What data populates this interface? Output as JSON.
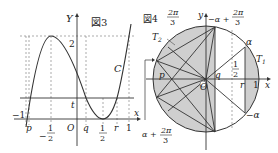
{
  "figure3": {
    "caption": "図3",
    "axis_x": "x",
    "axis_y": "Y",
    "origin": "O",
    "curve_label": "C",
    "y_tick_2": "2",
    "t_label": "t",
    "neg_one": "−1",
    "p": "p",
    "q": "q",
    "r": "r",
    "one": "1",
    "neg_half_sign": "−",
    "half_num": "1",
    "half_den": "2",
    "pos_half_num": "1",
    "pos_half_den": "2"
  },
  "figure4": {
    "caption": "図4",
    "axis_x": "x",
    "axis_y": "y",
    "origin": "O",
    "top_left_num": "2π",
    "top_left_den": "3",
    "top_label_prefix": "−α +",
    "top_label_num": "2π",
    "top_label_den": "3",
    "alpha": "α",
    "neg_alpha": "−α",
    "T1": "T",
    "T1_sub": "1",
    "T2": "T",
    "T2_sub": "2",
    "p": "p",
    "q": "q",
    "r": "r",
    "one": "1",
    "half_num": "1",
    "half_den": "2",
    "bottom_label_prefix": "α +",
    "bottom_label_num": "2π",
    "bottom_label_den": "3"
  },
  "colors": {
    "shade": "#cfcfcf",
    "line": "#333333",
    "dash": "#888888"
  }
}
